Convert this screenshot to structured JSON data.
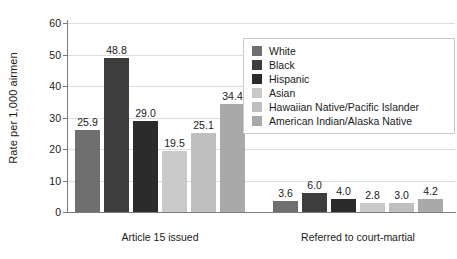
{
  "chart_data": {
    "type": "bar",
    "title": "",
    "xlabel": "",
    "ylabel": "Rate per 1,000 airmen",
    "ylim": [
      0,
      60
    ],
    "yticks": [
      0,
      10,
      20,
      30,
      40,
      50,
      60
    ],
    "ytick_labels": [
      "0",
      "10",
      "20",
      "30",
      "40",
      "50",
      "60"
    ],
    "grid": "horizontal",
    "legend_position": "upper-right",
    "categories": [
      "Article 15 issued",
      "Referred to court-martial"
    ],
    "series": [
      {
        "name": "White",
        "color": "#6f6f6f",
        "values": [
          25.9,
          3.6
        ],
        "labels": [
          "25.9",
          "3.6"
        ]
      },
      {
        "name": "Black",
        "color": "#3d3d3d",
        "values": [
          48.8,
          6.0
        ],
        "labels": [
          "48.8",
          "6.0"
        ]
      },
      {
        "name": "Hispanic",
        "color": "#2b2b2b",
        "values": [
          29.0,
          4.0
        ],
        "labels": [
          "29.0",
          "4.0"
        ]
      },
      {
        "name": "Asian",
        "color": "#c9c9c9",
        "values": [
          19.5,
          2.8
        ],
        "labels": [
          "19.5",
          "2.8"
        ]
      },
      {
        "name": "Hawaiian Native/Pacific Islander",
        "color": "#bfbfbf",
        "values": [
          25.1,
          3.0
        ],
        "labels": [
          "25.1",
          "3.0"
        ]
      },
      {
        "name": "American Indian/Alaska Native",
        "color": "#a9a9a9",
        "values": [
          34.4,
          4.2
        ],
        "labels": [
          "34.4",
          "4.2"
        ]
      }
    ]
  },
  "axes": {
    "y_title": "Rate per 1,000 airmen"
  },
  "legend": {
    "items": [
      {
        "label": "White",
        "color": "#6f6f6f"
      },
      {
        "label": "Black",
        "color": "#3d3d3d"
      },
      {
        "label": "Hispanic",
        "color": "#2b2b2b"
      },
      {
        "label": "Asian",
        "color": "#c9c9c9"
      },
      {
        "label": "Hawaiian Native/Pacific Islander",
        "color": "#bfbfbf"
      },
      {
        "label": "American Indian/Alaska Native",
        "color": "#a9a9a9"
      }
    ]
  }
}
